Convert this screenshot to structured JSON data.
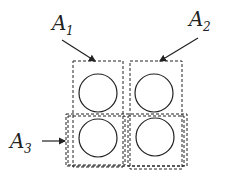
{
  "diagram": {
    "labels": [
      {
        "id": "A1",
        "base": "A",
        "subscript": "1"
      },
      {
        "id": "A2",
        "base": "A",
        "subscript": "2"
      },
      {
        "id": "A3",
        "base": "A",
        "subscript": "3"
      }
    ],
    "elements": {
      "circles": 4,
      "regions": [
        "A1",
        "A2",
        "A3"
      ]
    },
    "colors": {
      "stroke": "#222222",
      "background": "#ffffff"
    }
  }
}
